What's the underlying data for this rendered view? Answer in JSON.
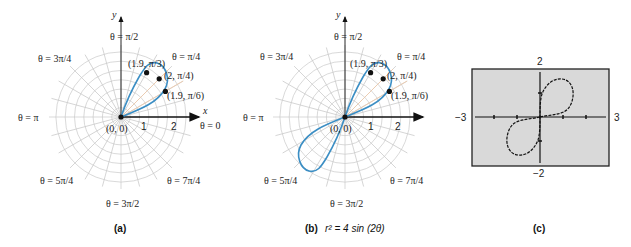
{
  "figure": {
    "panels": [
      {
        "id": "a",
        "caption": "(a)",
        "type": "polar-graph",
        "center": [
          121,
          117
        ],
        "axis_labels": {
          "x": "x",
          "y": "y"
        },
        "origin_label": "(0, 0)",
        "radial_ticks": [
          "1",
          "2"
        ],
        "angle_labels": {
          "theta_0": "θ = 0",
          "theta_pi_4": "θ = π/4",
          "theta_pi_2": "θ = π/2",
          "theta_3pi_4": "θ = 3π/4",
          "theta_pi": "θ = π",
          "theta_5pi_4": "θ = 5π/4",
          "theta_3pi_2": "θ = 3π/2",
          "theta_7pi_4": "θ = 7π/4"
        },
        "points": [
          {
            "label": "(1.9, π/3)",
            "r": 1.9,
            "theta": "π/3"
          },
          {
            "label": "(2, π/4)",
            "r": 2,
            "theta": "π/4"
          },
          {
            "label": "(1.9, π/6)",
            "r": 1.9,
            "theta": "π/6"
          }
        ]
      },
      {
        "id": "b",
        "caption": "(b)",
        "equation": "r² = 4 sin (2θ)",
        "type": "polar-graph",
        "center": [
          345,
          117
        ],
        "axis_labels": {
          "x": "x",
          "y": "y"
        },
        "origin_label": "(0, 0)",
        "radial_ticks": [
          "1",
          "2"
        ],
        "angle_labels": {
          "theta_0": "θ = 0",
          "theta_pi_4": "θ = π/4",
          "theta_pi_2": "θ = π/2",
          "theta_3pi_4": "θ = 3π/4",
          "theta_pi": "θ = π",
          "theta_5pi_4": "θ = 5π/4",
          "theta_3pi_2": "θ = 3π/2",
          "theta_7pi_4": "θ = 7π/4"
        },
        "points": [
          {
            "label": "(1.9, π/3)",
            "r": 1.9,
            "theta": "π/3"
          },
          {
            "label": "(2, π/4)",
            "r": 2,
            "theta": "π/4"
          },
          {
            "label": "(1.9, π/6)",
            "r": 1.9,
            "theta": "π/6"
          }
        ]
      },
      {
        "id": "c",
        "caption": "(c)",
        "type": "graphing-calculator-screen",
        "window": {
          "xmin": "−3",
          "xmax": "3",
          "ymin": "−2",
          "ymax": "2"
        }
      }
    ],
    "colors": {
      "curve": "#3b8ec4",
      "grid": "#c8c8c8",
      "axis": "#111111",
      "screen_bg": "#d9d9d9",
      "screen_border": "#222222"
    }
  }
}
